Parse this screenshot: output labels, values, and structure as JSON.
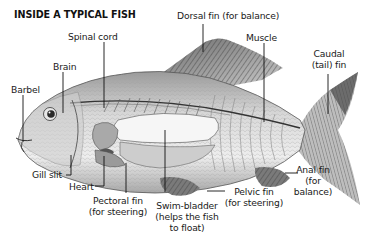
{
  "title": "INSIDE A TYPICAL FISH",
  "labels": {
    "dorsal_fin": "Dorsal fin (for balance)",
    "spinal_cord": "Spinal cord",
    "muscle": "Muscle",
    "caudal_line1": "Caudal",
    "caudal_line2": "(tail) fin",
    "brain": "Brain",
    "barbel": "Barbel",
    "gill_slit": "Gill slit",
    "heart": "Heart",
    "pectoral_line1": "Pectoral fin",
    "pectoral_line2": "(for steering)",
    "swim_line1": "Swim-bladder",
    "swim_line2": "(helps the fish",
    "swim_line3": "to float)",
    "pelvic_line1": "Pelvic fin",
    "pelvic_line2": "(for steering)",
    "anal_line1": "Anal fin",
    "anal_line2": "(for",
    "anal_line3": "balance)"
  },
  "colors": {
    "ink": "#1a1a1a",
    "body_light": "#e6e6e6",
    "body_mid": "#bdbdbd",
    "fin_dark": "#5a5a5a",
    "swim_bladder": "#f4f4f4"
  }
}
